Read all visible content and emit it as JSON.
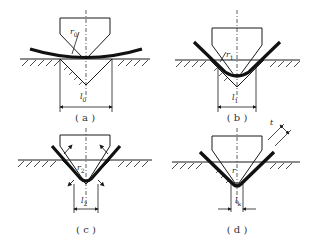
{
  "figure": {
    "panels": [
      {
        "id": "a",
        "caption": "( a )",
        "stage": "initial bending, sheet resting on die shoulders",
        "radius_label": "r",
        "radius_subscript": "0",
        "span_label": "l",
        "span_subscript": "0"
      },
      {
        "id": "b",
        "caption": "( b )",
        "stage": "sheet bent into die",
        "radius_label": "r",
        "radius_subscript": "1",
        "span_label": "l",
        "span_subscript": "1"
      },
      {
        "id": "c",
        "caption": "( c )",
        "stage": "sheet contacts punch with arrows showing contact forces",
        "radius_label": "r",
        "radius_subscript": "2",
        "span_label": "l",
        "span_subscript": "2"
      },
      {
        "id": "d",
        "caption": "( d )",
        "stage": "final bottoming, sheet conforms to die",
        "radius_label": "r",
        "radius_subscript": "",
        "span_label": "l",
        "span_subscript": "k",
        "thickness_label": "t"
      }
    ],
    "colors": {
      "line": "#1a1a1a",
      "sheet": "#111111",
      "hatch": "#333333",
      "background": "#ffffff"
    }
  }
}
